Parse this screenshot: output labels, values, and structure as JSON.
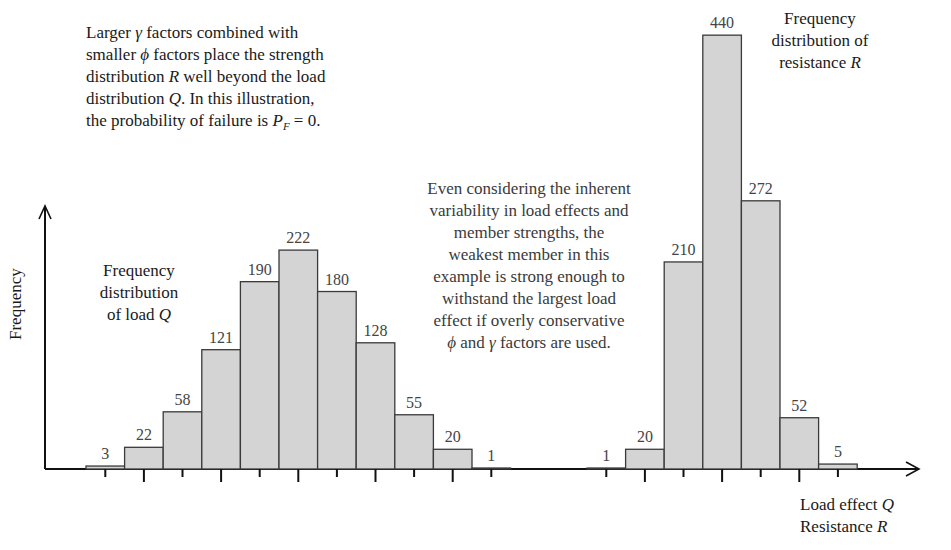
{
  "chart_data": {
    "type": "bar",
    "title": "",
    "xlabel": "Load effect Q / Resistance R",
    "ylabel": "Frequency",
    "grid": false,
    "series": [
      {
        "name": "Frequency distribution of load Q",
        "categories": [
          "1",
          "2",
          "3",
          "4",
          "5",
          "6",
          "7",
          "8",
          "9",
          "10",
          "11"
        ],
        "values": [
          3,
          22,
          58,
          121,
          190,
          222,
          180,
          128,
          55,
          20,
          1
        ]
      },
      {
        "name": "Frequency distribution of resistance R",
        "categories": [
          "1",
          "2",
          "3",
          "4",
          "5",
          "6",
          "7"
        ],
        "values": [
          1,
          20,
          210,
          440,
          272,
          52,
          5
        ]
      }
    ],
    "ylim": [
      0,
      450
    ],
    "annotations": [
      "Larger γ factors combined with smaller ϕ factors place the strength distribution R well beyond the load distribution Q. In this illustration, the probability of failure is P_F = 0.",
      "Even considering the inherent variability in load effects and member strengths, the weakest member in this example is strong enough to withstand the largest load effect if overly conservative ϕ and γ factors are used."
    ]
  },
  "text": {
    "note1": [
      "Larger γ factors combined with",
      "smaller ϕ factors place the strength",
      "distribution R well beyond the load",
      "distribution Q.  In this illustration,",
      "the probability of failure is P_F = 0."
    ],
    "note2": [
      "Even considering the inherent",
      "variability in load effects and",
      "member strengths, the",
      "weakest member in this",
      "example is strong enough to",
      "withstand the largest load",
      "effect if overly conservative",
      "ϕ and γ factors are used."
    ],
    "load_label": [
      "Frequency",
      "distribution",
      "of load Q"
    ],
    "resist_label": [
      "Frequency",
      "distribution of",
      "resistance R"
    ],
    "y_axis": "Frequency",
    "x_axis_1": "Load effect  Q",
    "x_axis_2": "Resistance R"
  },
  "colors": {
    "bar_fill": "#d4d4d4",
    "bar_stroke": "#3a3a3a",
    "axis": "#111111"
  }
}
